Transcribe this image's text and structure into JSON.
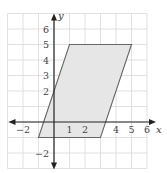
{
  "diagram": {
    "type": "coordinate-plane-shape",
    "shape": "parallelogram",
    "vertices": [
      [
        -1,
        -1
      ],
      [
        3,
        -1
      ],
      [
        5,
        5
      ],
      [
        1,
        5
      ]
    ],
    "fill_color": "#e6e6e6",
    "edge_color": "#666666",
    "grid_color": "#d9d9d9",
    "axis_color": "#222222",
    "x_range": [
      -3,
      6
    ],
    "y_range": [
      -3,
      7
    ],
    "axes": {
      "x_label": "x",
      "y_label": "y"
    },
    "x_ticks": [
      {
        "value": -2,
        "label": "−2"
      },
      {
        "value": 1,
        "label": "1"
      },
      {
        "value": 2,
        "label": "2"
      },
      {
        "value": 4,
        "label": "4"
      },
      {
        "value": 5,
        "label": "5"
      },
      {
        "value": 6,
        "label": "6"
      }
    ],
    "y_ticks": [
      {
        "value": 6,
        "label": "6"
      },
      {
        "value": 5,
        "label": "5"
      },
      {
        "value": 4,
        "label": "4"
      },
      {
        "value": 3,
        "label": "3"
      },
      {
        "value": 2,
        "label": "2"
      },
      {
        "value": -2,
        "label": "−2"
      }
    ]
  }
}
